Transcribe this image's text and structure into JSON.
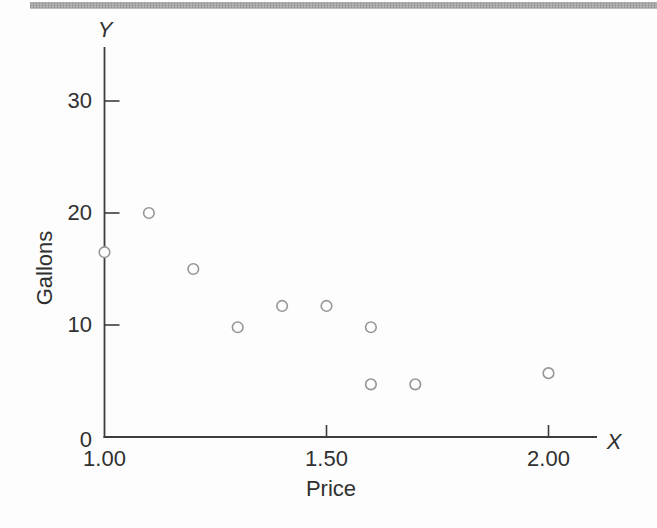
{
  "page": {
    "background": "#fdfdfd",
    "top_band_color": "#cccccc"
  },
  "chart_data": {
    "type": "scatter",
    "title": "",
    "y_variable_label": "Y",
    "x_variable_label": "X",
    "ylabel": "Gallons",
    "xlabel": "Price",
    "y_ticks": [
      {
        "value": 0,
        "label": "0"
      },
      {
        "value": 10,
        "label": "10"
      },
      {
        "value": 20,
        "label": "20"
      },
      {
        "value": 30,
        "label": "30"
      }
    ],
    "x_ticks": [
      {
        "value": 1.0,
        "label": "1.00"
      },
      {
        "value": 1.5,
        "label": "1.50"
      },
      {
        "value": 2.0,
        "label": "2.00"
      }
    ],
    "xlim": [
      1.0,
      2.11
    ],
    "ylim": [
      0,
      34.8
    ],
    "grid": false,
    "legend": null,
    "marker": "open-circle",
    "points": [
      {
        "x": 1.0,
        "y": 16.5
      },
      {
        "x": 1.1,
        "y": 20.0
      },
      {
        "x": 1.2,
        "y": 15.0
      },
      {
        "x": 1.3,
        "y": 9.8
      },
      {
        "x": 1.4,
        "y": 11.7
      },
      {
        "x": 1.5,
        "y": 11.7
      },
      {
        "x": 1.6,
        "y": 9.8
      },
      {
        "x": 1.6,
        "y": 4.7
      },
      {
        "x": 1.7,
        "y": 4.7
      },
      {
        "x": 2.0,
        "y": 5.7
      }
    ],
    "colors": {
      "axis": "#3d3d3d",
      "tick": "#3d3d3d",
      "text": "#303030",
      "marker_stroke": "#969696",
      "marker_fill": "#fdfdfd"
    }
  }
}
